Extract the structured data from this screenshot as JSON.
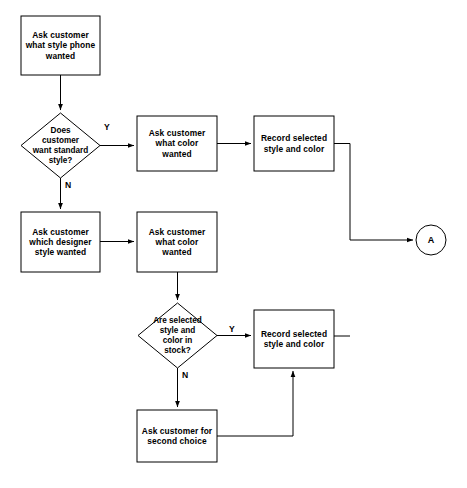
{
  "diagram": {
    "canvas": {
      "width": 467,
      "height": 488
    },
    "style": {
      "background": "#ffffff",
      "stroke": "#000000",
      "text": "#000000",
      "fill": "#ffffff"
    }
  },
  "nodes": {
    "ask_style": {
      "shape": "process",
      "label": "Ask customer\nwhat style phone\nwanted",
      "x": 21,
      "y": 16,
      "w": 79,
      "h": 59
    },
    "decide_standard": {
      "shape": "decision",
      "label": "Does\ncustomer\nwant standard\nstyle?",
      "x": 21,
      "y": 113,
      "w": 79,
      "h": 65
    },
    "ask_color_top": {
      "shape": "process",
      "label": "Ask customer\nwhat color\nwanted",
      "x": 137,
      "y": 116,
      "w": 80,
      "h": 55
    },
    "record_top": {
      "shape": "process",
      "label": "Record selected\nstyle and color",
      "x": 254,
      "y": 116,
      "w": 80,
      "h": 55
    },
    "ask_designer": {
      "shape": "process",
      "label": "Ask customer\nwhich designer\nstyle wanted",
      "x": 21,
      "y": 212,
      "w": 79,
      "h": 60
    },
    "ask_color_mid": {
      "shape": "process",
      "label": "Ask customer\nwhat color\nwanted",
      "x": 137,
      "y": 212,
      "w": 80,
      "h": 60
    },
    "decide_stock": {
      "shape": "decision",
      "label": "Are selected\nstyle and\ncolor in\nstock?",
      "x": 138,
      "y": 303,
      "w": 79,
      "h": 65
    },
    "record_bottom": {
      "shape": "process",
      "label": "Record selected\nstyle and color",
      "x": 254,
      "y": 310,
      "w": 80,
      "h": 58
    },
    "ask_second_choice": {
      "shape": "process",
      "label": "Ask customer for\nsecond choice",
      "x": 137,
      "y": 410,
      "w": 80,
      "h": 52
    },
    "connector_a": {
      "shape": "connector-circle",
      "label": "A",
      "cx": 431,
      "cy": 240,
      "r": 15
    }
  },
  "edge_labels": {
    "standard_yes": {
      "text": "Y",
      "x": 104,
      "y": 122
    },
    "standard_no": {
      "text": "N",
      "x": 65,
      "y": 180
    },
    "stock_yes": {
      "text": "Y",
      "x": 229,
      "y": 324
    },
    "stock_no": {
      "text": "N",
      "x": 182,
      "y": 370
    }
  },
  "edges": [
    {
      "name": "ask-style-to-decision",
      "from": "ask_style",
      "to": "decide_standard",
      "arrow": true
    },
    {
      "name": "decision-yes-to-ask-color-top",
      "from": "decide_standard",
      "to": "ask_color_top",
      "label": "Y",
      "arrow": true
    },
    {
      "name": "decision-no-to-ask-designer",
      "from": "decide_standard",
      "to": "ask_designer",
      "label": "N",
      "arrow": true
    },
    {
      "name": "ask-color-top-to-record-top",
      "from": "ask_color_top",
      "to": "record_top",
      "arrow": true
    },
    {
      "name": "record-top-to-connector-a",
      "from": "record_top",
      "to": "connector_a",
      "arrow": true
    },
    {
      "name": "ask-designer-to-ask-color-mid",
      "from": "ask_designer",
      "to": "ask_color_mid",
      "arrow": true
    },
    {
      "name": "ask-color-mid-to-decision-stock",
      "from": "ask_color_mid",
      "to": "decide_stock",
      "arrow": true
    },
    {
      "name": "stock-yes-to-record-bottom",
      "from": "decide_stock",
      "to": "record_bottom",
      "label": "Y",
      "arrow": true
    },
    {
      "name": "stock-no-to-second-choice",
      "from": "decide_stock",
      "to": "ask_second_choice",
      "label": "N",
      "arrow": true
    },
    {
      "name": "second-choice-to-record-bottom",
      "from": "ask_second_choice",
      "to": "record_bottom",
      "arrow": true
    },
    {
      "name": "record-bottom-to-connector-a",
      "from": "record_bottom",
      "to": "connector_a",
      "arrow": false
    }
  ]
}
